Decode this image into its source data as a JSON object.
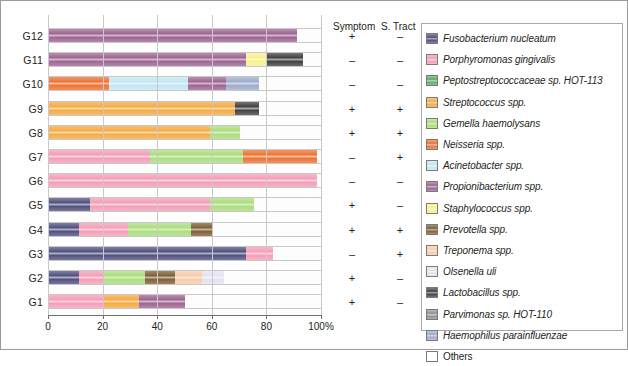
{
  "chart_data": {
    "type": "bar",
    "orientation": "horizontal",
    "stacked": true,
    "title": "",
    "xlabel": "",
    "ylabel": "",
    "xlim": [
      0,
      100
    ],
    "xunit": "%",
    "xticks": [
      0,
      20,
      40,
      60,
      80,
      100
    ],
    "xticklabels": [
      "0",
      "20",
      "40",
      "60",
      "80",
      "100%"
    ],
    "grid": true,
    "legend_position": "right",
    "categories": [
      "G12",
      "G11",
      "G10",
      "G9",
      "G8",
      "G7",
      "G6",
      "G5",
      "G4",
      "G3",
      "G2",
      "G1"
    ],
    "series": [
      {
        "name": "Fusobacterium nucleatum",
        "color": "#4a4a7a",
        "values": [
          0,
          0,
          0,
          0,
          0,
          0,
          0,
          15,
          11,
          72,
          11,
          0
        ]
      },
      {
        "name": "Porphyromonas gingivalis",
        "color": "#f49ab4",
        "values": [
          0,
          0,
          0,
          0,
          0,
          37,
          98,
          44,
          18,
          10,
          9,
          20
        ]
      },
      {
        "name": "Peptostreptococcaceae sp. HOT-113",
        "color": "#5fa85f",
        "values": [
          0,
          0,
          0,
          0,
          0,
          0,
          0,
          0,
          0,
          0,
          0,
          0
        ]
      },
      {
        "name": "Streptococcus spp.",
        "color": "#f5a73c",
        "values": [
          0,
          0,
          0,
          68,
          59,
          0,
          0,
          0,
          0,
          0,
          0,
          13
        ]
      },
      {
        "name": "Gemella haemolysans",
        "color": "#a8dc78",
        "values": [
          0,
          0,
          0,
          0,
          11,
          34,
          0,
          16,
          23,
          0,
          15,
          0
        ]
      },
      {
        "name": "Neisseria spp.",
        "color": "#ee6d2a",
        "values": [
          0,
          0,
          22,
          0,
          0,
          27,
          0,
          0,
          0,
          0,
          0,
          0
        ]
      },
      {
        "name": "Acinetobacter spp.",
        "color": "#bfe6f2",
        "values": [
          0,
          0,
          29,
          0,
          0,
          0,
          0,
          0,
          0,
          0,
          0,
          0
        ]
      },
      {
        "name": "Propionibacterium spp.",
        "color": "#9a5f8e",
        "values": [
          91,
          72,
          14,
          0,
          0,
          0,
          0,
          0,
          0,
          0,
          0,
          17
        ]
      },
      {
        "name": "Staphylococcus spp.",
        "color": "#f7f08a",
        "values": [
          0,
          8,
          0,
          0,
          0,
          0,
          0,
          0,
          0,
          0,
          0,
          0
        ]
      },
      {
        "name": "Prevotella spp.",
        "color": "#7a5a2e",
        "values": [
          0,
          0,
          0,
          0,
          0,
          0,
          0,
          0,
          8,
          0,
          11,
          0
        ]
      },
      {
        "name": "Treponema spp.",
        "color": "#f7c9a8",
        "values": [
          0,
          0,
          0,
          0,
          0,
          0,
          0,
          0,
          0,
          0,
          10,
          0
        ]
      },
      {
        "name": "Olsenella uli",
        "color": "#e2e2f0",
        "values": [
          0,
          0,
          0,
          0,
          0,
          0,
          0,
          0,
          0,
          0,
          8,
          0
        ]
      },
      {
        "name": "Lactobacillus spp.",
        "color": "#3a3a3a",
        "values": [
          0,
          13,
          0,
          9,
          0,
          0,
          0,
          0,
          0,
          0,
          0,
          0
        ]
      },
      {
        "name": "Parvimonas sp. HOT-110",
        "color": "#8c8c94",
        "values": [
          0,
          0,
          0,
          0,
          0,
          0,
          0,
          0,
          0,
          0,
          0,
          0
        ]
      },
      {
        "name": "Haemophilus parainfluenzae",
        "color": "#9aa8cc",
        "values": [
          0,
          0,
          12,
          0,
          0,
          0,
          0,
          0,
          0,
          0,
          0,
          0
        ]
      },
      {
        "name": "Others",
        "color": "#ffffff",
        "values": [
          9,
          7,
          23,
          23,
          30,
          2,
          2,
          25,
          40,
          18,
          46,
          50
        ]
      }
    ],
    "bars": [
      {
        "category": "G12",
        "segments": [
          {
            "name": "Propionibacterium spp.",
            "start": 0,
            "end": 91,
            "color": "#9a5f8e"
          },
          {
            "name": "Others",
            "start": 91,
            "end": 100,
            "color": "#ffffff"
          }
        ]
      },
      {
        "category": "G11",
        "segments": [
          {
            "name": "Propionibacterium spp.",
            "start": 0,
            "end": 72,
            "color": "#9a5f8e"
          },
          {
            "name": "Staphylococcus spp.",
            "start": 72,
            "end": 80,
            "color": "#f7f08a"
          },
          {
            "name": "Lactobacillus spp.",
            "start": 80,
            "end": 93,
            "color": "#3a3a3a"
          },
          {
            "name": "Others",
            "start": 93,
            "end": 100,
            "color": "#ffffff"
          }
        ]
      },
      {
        "category": "G10",
        "segments": [
          {
            "name": "Neisseria spp.",
            "start": 0,
            "end": 22,
            "color": "#ee6d2a"
          },
          {
            "name": "Acinetobacter spp.",
            "start": 22,
            "end": 51,
            "color": "#bfe6f2"
          },
          {
            "name": "Propionibacterium spp.",
            "start": 51,
            "end": 65,
            "color": "#9a5f8e"
          },
          {
            "name": "Haemophilus parainfluenzae",
            "start": 65,
            "end": 77,
            "color": "#9aa8cc"
          },
          {
            "name": "Others",
            "start": 77,
            "end": 100,
            "color": "#ffffff"
          }
        ]
      },
      {
        "category": "G9",
        "segments": [
          {
            "name": "Streptococcus spp.",
            "start": 0,
            "end": 68,
            "color": "#f5a73c"
          },
          {
            "name": "Lactobacillus spp.",
            "start": 68,
            "end": 77,
            "color": "#3a3a3a"
          },
          {
            "name": "Others",
            "start": 77,
            "end": 100,
            "color": "#ffffff"
          }
        ]
      },
      {
        "category": "G8",
        "segments": [
          {
            "name": "Streptococcus spp.",
            "start": 0,
            "end": 59,
            "color": "#f5a73c"
          },
          {
            "name": "Gemella haemolysans",
            "start": 59,
            "end": 70,
            "color": "#a8dc78"
          },
          {
            "name": "Others",
            "start": 70,
            "end": 100,
            "color": "#ffffff"
          }
        ]
      },
      {
        "category": "G7",
        "segments": [
          {
            "name": "Porphyromonas gingivalis",
            "start": 0,
            "end": 37,
            "color": "#f49ab4"
          },
          {
            "name": "Gemella haemolysans",
            "start": 37,
            "end": 71,
            "color": "#a8dc78"
          },
          {
            "name": "Neisseria spp.",
            "start": 71,
            "end": 98,
            "color": "#ee6d2a"
          },
          {
            "name": "Others",
            "start": 98,
            "end": 100,
            "color": "#ffffff"
          }
        ]
      },
      {
        "category": "G6",
        "segments": [
          {
            "name": "Porphyromonas gingivalis",
            "start": 0,
            "end": 98,
            "color": "#f49ab4"
          },
          {
            "name": "Others",
            "start": 98,
            "end": 100,
            "color": "#ffffff"
          }
        ]
      },
      {
        "category": "G5",
        "segments": [
          {
            "name": "Fusobacterium nucleatum",
            "start": 0,
            "end": 15,
            "color": "#4a4a7a"
          },
          {
            "name": "Porphyromonas gingivalis",
            "start": 15,
            "end": 59,
            "color": "#f49ab4"
          },
          {
            "name": "Gemella haemolysans",
            "start": 59,
            "end": 75,
            "color": "#a8dc78"
          },
          {
            "name": "Others",
            "start": 75,
            "end": 100,
            "color": "#ffffff"
          }
        ]
      },
      {
        "category": "G4",
        "segments": [
          {
            "name": "Fusobacterium nucleatum",
            "start": 0,
            "end": 11,
            "color": "#4a4a7a"
          },
          {
            "name": "Porphyromonas gingivalis",
            "start": 11,
            "end": 29,
            "color": "#f49ab4"
          },
          {
            "name": "Gemella haemolysans",
            "start": 29,
            "end": 52,
            "color": "#a8dc78"
          },
          {
            "name": "Prevotella spp.",
            "start": 52,
            "end": 60,
            "color": "#7a5a2e"
          },
          {
            "name": "Others",
            "start": 60,
            "end": 100,
            "color": "#ffffff"
          }
        ]
      },
      {
        "category": "G3",
        "segments": [
          {
            "name": "Fusobacterium nucleatum",
            "start": 0,
            "end": 72,
            "color": "#4a4a7a"
          },
          {
            "name": "Porphyromonas gingivalis",
            "start": 72,
            "end": 82,
            "color": "#f49ab4"
          },
          {
            "name": "Others",
            "start": 82,
            "end": 100,
            "color": "#ffffff"
          }
        ]
      },
      {
        "category": "G2",
        "segments": [
          {
            "name": "Fusobacterium nucleatum",
            "start": 0,
            "end": 11,
            "color": "#4a4a7a"
          },
          {
            "name": "Porphyromonas gingivalis",
            "start": 11,
            "end": 20,
            "color": "#f49ab4"
          },
          {
            "name": "Gemella haemolysans",
            "start": 20,
            "end": 35,
            "color": "#a8dc78"
          },
          {
            "name": "Prevotella spp.",
            "start": 35,
            "end": 46,
            "color": "#7a5a2e"
          },
          {
            "name": "Treponema spp.",
            "start": 46,
            "end": 56,
            "color": "#f7c9a8"
          },
          {
            "name": "Olsenella uli",
            "start": 56,
            "end": 64,
            "color": "#e2e2f0"
          },
          {
            "name": "Others",
            "start": 64,
            "end": 100,
            "color": "#ffffff"
          }
        ]
      },
      {
        "category": "G1",
        "segments": [
          {
            "name": "Porphyromonas gingivalis",
            "start": 0,
            "end": 20,
            "color": "#f49ab4"
          },
          {
            "name": "Streptococcus spp.",
            "start": 20,
            "end": 33,
            "color": "#f5a73c"
          },
          {
            "name": "Propionibacterium spp.",
            "start": 33,
            "end": 50,
            "color": "#9a5f8e"
          },
          {
            "name": "Others",
            "start": 50,
            "end": 100,
            "color": "#ffffff"
          }
        ]
      }
    ],
    "annotation_columns": [
      {
        "header": "Symptom",
        "values": [
          "+",
          "–",
          "–",
          "+",
          "+",
          "–",
          "–",
          "+",
          "+",
          "–",
          "+",
          "+"
        ]
      },
      {
        "header": "S. Tract",
        "values": [
          "–",
          "–",
          "–",
          "+",
          "+",
          "+",
          "–",
          "–",
          "+",
          "+",
          "–",
          "–"
        ]
      }
    ],
    "legend": [
      {
        "label": "Fusobacterium nucleatum",
        "color": "#4a4a7a",
        "italic": true
      },
      {
        "label": "Porphyromonas gingivalis",
        "color": "#f49ab4",
        "italic": true
      },
      {
        "label": "Peptostreptococcaceae sp. HOT-113",
        "color": "#5fa85f",
        "italic": true
      },
      {
        "label": "Streptococcus spp.",
        "color": "#f5a73c",
        "italic": true
      },
      {
        "label": "Gemella haemolysans",
        "color": "#a8dc78",
        "italic": true
      },
      {
        "label": "Neisseria spp.",
        "color": "#ee6d2a",
        "italic": true
      },
      {
        "label": "Acinetobacter spp.",
        "color": "#bfe6f2",
        "italic": true
      },
      {
        "label": "Propionibacterium spp.",
        "color": "#9a5f8e",
        "italic": true
      },
      {
        "label": "Staphylococcus spp.",
        "color": "#f7f08a",
        "italic": true
      },
      {
        "label": "Prevotella spp.",
        "color": "#7a5a2e",
        "italic": true
      },
      {
        "label": "Treponema spp.",
        "color": "#f7c9a8",
        "italic": true
      },
      {
        "label": "Olsenella uli",
        "color": "#e2e2f0",
        "italic": true
      },
      {
        "label": "Lactobacillus spp.",
        "color": "#3a3a3a",
        "italic": true
      },
      {
        "label": "Parvimonas sp. HOT-110",
        "color": "#8c8c94",
        "italic": true
      },
      {
        "label": "Haemophilus parainfluenzae",
        "color": "#9aa8cc",
        "italic": true
      },
      {
        "label": "Others",
        "color": "#ffffff",
        "italic": false
      }
    ]
  }
}
